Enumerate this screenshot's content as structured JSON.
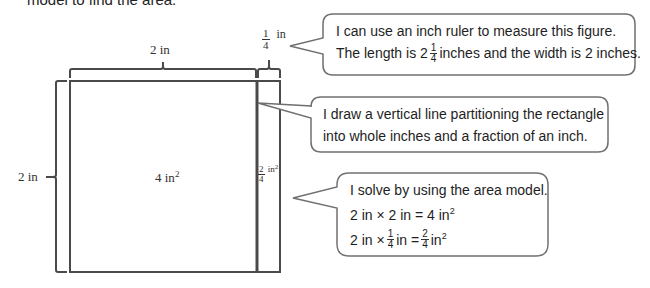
{
  "header": {
    "cut_text": "model to find the area."
  },
  "diagram": {
    "top_label_whole": "2 in",
    "top_label_fraction": {
      "numerator": "1",
      "denominator": "4",
      "unit": "in"
    },
    "side_label": "2 in",
    "region_whole_area": "4 in",
    "region_whole_exp": "2",
    "region_fraction_area": {
      "numerator": "2",
      "denominator": "4",
      "unit": "in",
      "exp": "2"
    }
  },
  "bubbles": [
    {
      "line1": "I can use an inch ruler to measure this figure.",
      "line2_pre": "The length is 2",
      "line2_frac": {
        "numerator": "1",
        "denominator": "4"
      },
      "line2_post": "inches and the width is 2 inches."
    },
    {
      "line1": "I draw a vertical line partitioning the rectangle",
      "line2": "into whole inches and a fraction of an inch."
    },
    {
      "line1": "I solve by using the area model.",
      "line2": "2 in × 2 in = 4 in",
      "line2_exp": "2",
      "line3_pre": "2 in ×",
      "line3_frac1": {
        "numerator": "1",
        "denominator": "4"
      },
      "line3_mid": "in =",
      "line3_frac2": {
        "numerator": "2",
        "denominator": "4"
      },
      "line3_post": "in",
      "line3_exp": "2"
    }
  ],
  "colors": {
    "stroke": "#4a4a4a",
    "bubble_stroke": "#707070",
    "text": "#1e1e1e"
  }
}
